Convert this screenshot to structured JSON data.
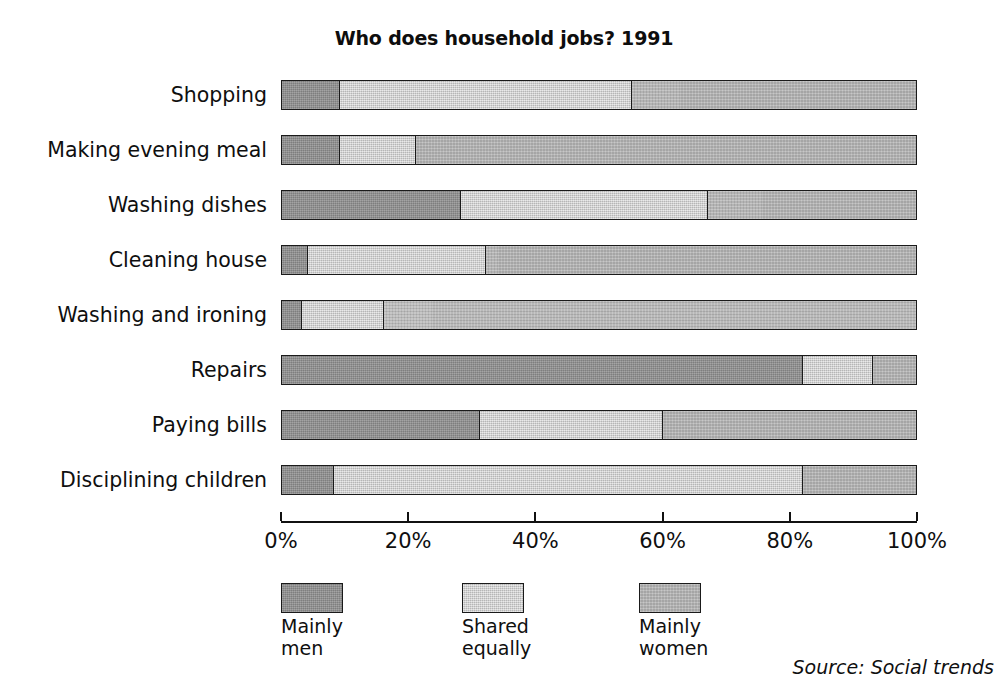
{
  "chart_data": {
    "type": "bar",
    "orientation": "horizontal",
    "stacked": true,
    "stacked_mode": "percent",
    "title": "Who does household jobs? 1991",
    "xlabel": "",
    "ylabel": "",
    "xlim": [
      0,
      100
    ],
    "grid": false,
    "legend_position": "bottom",
    "source": "Source: Social trends",
    "xticks": [
      0,
      20,
      40,
      60,
      80,
      100
    ],
    "xtick_labels": [
      "0%",
      "20%",
      "40%",
      "60%",
      "80%",
      "100%"
    ],
    "categories": [
      "Shopping",
      "Making evening meal",
      "Washing dishes",
      "Cleaning house",
      "Washing and ironing",
      "Repairs",
      "Paying bills",
      "Disciplining children"
    ],
    "series": [
      {
        "name": "Mainly men",
        "color": "#8d8d8d",
        "values": [
          9,
          9,
          28,
          4,
          3,
          82,
          31,
          8
        ]
      },
      {
        "name": "Shared equally",
        "color": "#d4d4d4",
        "values": [
          46,
          12,
          39,
          28,
          13,
          11,
          29,
          74
        ]
      },
      {
        "name": "Mainly women",
        "color": "#b5b5b5",
        "values": [
          45,
          79,
          33,
          68,
          84,
          7,
          40,
          18
        ]
      }
    ]
  },
  "legend": {
    "items": [
      {
        "line1": "Mainly",
        "line2": "men"
      },
      {
        "line1": "Shared",
        "line2": "equally"
      },
      {
        "line1": "Mainly",
        "line2": "women"
      }
    ]
  }
}
